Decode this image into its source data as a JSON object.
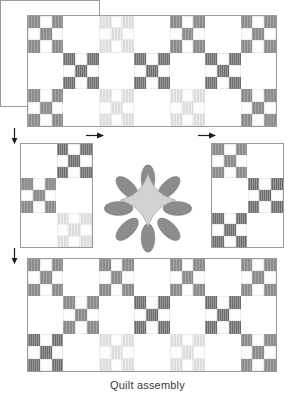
{
  "caption": "Quilt assembly",
  "colors": {
    "outline": "#9a9a9a",
    "background": "#ffffff",
    "patch_medium": "#8c8c8c",
    "patch_dark": "#6b6b6b",
    "patch_pale": "#dcdcdc",
    "petal": "#8c8c8c",
    "flower_center": "#d2d2d2",
    "arrow": "#1a1a1a",
    "caption_text": "#3a3a3a"
  },
  "panels": {
    "top": {
      "name": "Top border row",
      "cols": 7,
      "rows": 3,
      "blocks": [
        {
          "type": "ninepatch",
          "shade": "medium"
        },
        {
          "type": "plain"
        },
        {
          "type": "ninepatch",
          "shade": "pale"
        },
        {
          "type": "plain"
        },
        {
          "type": "ninepatch",
          "shade": "medium"
        },
        {
          "type": "plain"
        },
        {
          "type": "ninepatch",
          "shade": "medium"
        },
        {
          "type": "plain"
        },
        {
          "type": "ninepatch",
          "shade": "dark"
        },
        {
          "type": "plain"
        },
        {
          "type": "ninepatch",
          "shade": "dark"
        },
        {
          "type": "plain"
        },
        {
          "type": "ninepatch",
          "shade": "dark"
        },
        {
          "type": "plain"
        },
        {
          "type": "ninepatch",
          "shade": "medium"
        },
        {
          "type": "plain"
        },
        {
          "type": "ninepatch",
          "shade": "pale"
        },
        {
          "type": "plain"
        },
        {
          "type": "ninepatch",
          "shade": "pale"
        },
        {
          "type": "plain"
        },
        {
          "type": "ninepatch",
          "shade": "medium"
        }
      ]
    },
    "left": {
      "name": "Left side row",
      "cols": 2,
      "rows": 3,
      "blocks": [
        {
          "type": "plain"
        },
        {
          "type": "ninepatch",
          "shade": "dark"
        },
        {
          "type": "ninepatch",
          "shade": "medium"
        },
        {
          "type": "plain"
        },
        {
          "type": "plain"
        },
        {
          "type": "ninepatch",
          "shade": "pale"
        }
      ]
    },
    "right": {
      "name": "Right side row",
      "cols": 2,
      "rows": 3,
      "blocks": [
        {
          "type": "ninepatch",
          "shade": "medium"
        },
        {
          "type": "plain"
        },
        {
          "type": "plain"
        },
        {
          "type": "ninepatch",
          "shade": "dark"
        },
        {
          "type": "ninepatch",
          "shade": "dark"
        },
        {
          "type": "plain"
        }
      ]
    },
    "center": {
      "name": "Center applique block",
      "motif": "eight-petal flower",
      "petals": 8,
      "center_shape": "concave diamond"
    },
    "bottom": {
      "name": "Bottom border row",
      "cols": 7,
      "rows": 3,
      "blocks": [
        {
          "type": "ninepatch",
          "shade": "medium"
        },
        {
          "type": "plain"
        },
        {
          "type": "ninepatch",
          "shade": "medium"
        },
        {
          "type": "plain"
        },
        {
          "type": "ninepatch",
          "shade": "medium"
        },
        {
          "type": "plain"
        },
        {
          "type": "ninepatch",
          "shade": "medium"
        },
        {
          "type": "plain"
        },
        {
          "type": "ninepatch",
          "shade": "medium"
        },
        {
          "type": "plain"
        },
        {
          "type": "ninepatch",
          "shade": "dark"
        },
        {
          "type": "plain"
        },
        {
          "type": "ninepatch",
          "shade": "dark"
        },
        {
          "type": "plain"
        },
        {
          "type": "ninepatch",
          "shade": "dark"
        },
        {
          "type": "plain"
        },
        {
          "type": "ninepatch",
          "shade": "pale"
        },
        {
          "type": "plain"
        },
        {
          "type": "ninepatch",
          "shade": "pale"
        },
        {
          "type": "plain"
        },
        {
          "type": "ninepatch",
          "shade": "medium"
        }
      ]
    }
  },
  "arrows": [
    {
      "id": "seam-arrow-left-upper",
      "direction": "down",
      "x": 10,
      "y": 128
    },
    {
      "id": "seam-arrow-left-lower",
      "direction": "down",
      "x": 10,
      "y": 248
    },
    {
      "id": "seam-arrow-top-left",
      "direction": "right",
      "x": 86,
      "y": 131
    },
    {
      "id": "seam-arrow-top-right",
      "direction": "right",
      "x": 198,
      "y": 131
    }
  ]
}
